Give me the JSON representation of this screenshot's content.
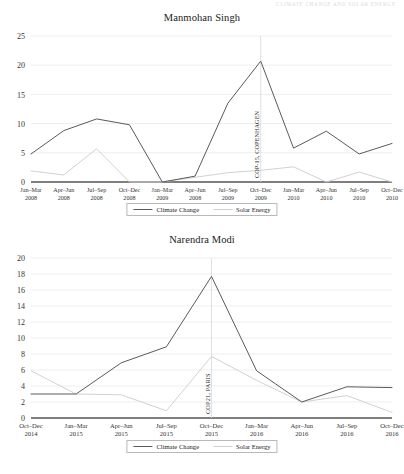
{
  "running_head": "CLIMATE CHANGE AND SOLAR ENERGY",
  "legend": {
    "climate_change": "Climate Change",
    "solar_energy": "Solar Energy"
  },
  "chart_data": [
    {
      "type": "line",
      "title": "Manmohan Singh",
      "xlabel": "",
      "ylabel": "",
      "ylim": [
        0,
        25
      ],
      "yticks": [
        0,
        5,
        10,
        15,
        20,
        25
      ],
      "grid": true,
      "legend_position": "bottom",
      "categories": [
        "Jan–Mar\n2008",
        "Apr–Jun\n2008",
        "Jul–Sep\n2008",
        "Oct–Dec\n2008",
        "Jan–Mar\n2009",
        "Apr–Jun\n2008",
        "Jul–Sep\n2009",
        "Oct–Dec\n2009",
        "Jan–Mar\n2010",
        "Apr–Jun\n2010",
        "Jul–Sep\n2010",
        "Oct–Dec\n2010"
      ],
      "series": [
        {
          "name": "Climate Change",
          "color": "#5a5a5a",
          "values": [
            4.8,
            8.8,
            10.8,
            9.8,
            0.0,
            1.0,
            13.5,
            20.7,
            5.8,
            8.7,
            4.8,
            6.6
          ]
        },
        {
          "name": "Solar Energy",
          "color": "#d2d2d2",
          "values": [
            1.9,
            1.2,
            5.7,
            0.0,
            0.0,
            0.8,
            1.6,
            2.0,
            2.6,
            0.0,
            1.7,
            0.0
          ]
        }
      ],
      "annotations": [
        {
          "text": "COP-15, COPENHAGEN",
          "category_index": 7,
          "orientation": "vertical"
        }
      ]
    },
    {
      "type": "line",
      "title": "Narendra Modi",
      "xlabel": "",
      "ylabel": "",
      "ylim": [
        0,
        20
      ],
      "yticks": [
        0,
        2,
        4,
        6,
        8,
        10,
        12,
        14,
        16,
        18,
        20
      ],
      "grid": true,
      "legend_position": "bottom",
      "categories": [
        "Oct–Dec\n2014",
        "Jan–Mar\n2015",
        "Apr–Jun\n2015",
        "Jul–Sep\n2015",
        "Oct–Dec\n2015",
        "Jan–Mar\n2016",
        "Apr–Jun\n2016",
        "Jul–Sep\n2016",
        "Oct–Dec\n2016"
      ],
      "series": [
        {
          "name": "Climate Change",
          "color": "#5a5a5a",
          "values": [
            3.0,
            3.0,
            6.9,
            8.9,
            17.7,
            5.9,
            2.0,
            3.9,
            3.8
          ]
        },
        {
          "name": "Solar Energy",
          "color": "#d2d2d2",
          "values": [
            5.9,
            3.0,
            2.9,
            0.9,
            7.7,
            4.7,
            2.0,
            2.8,
            0.7
          ]
        }
      ],
      "annotations": [
        {
          "text": "COP21, PARIS",
          "category_index": 4,
          "orientation": "vertical"
        }
      ]
    }
  ]
}
